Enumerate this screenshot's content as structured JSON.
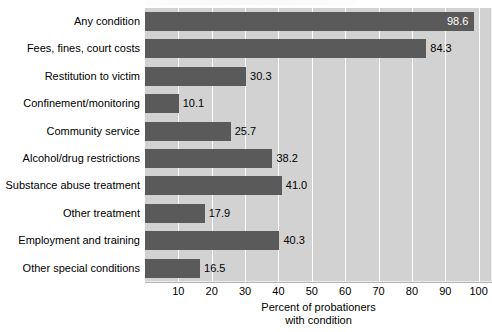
{
  "chart_data": {
    "type": "bar",
    "orientation": "horizontal",
    "title": "",
    "xlabel": "Percent of probationers with condition",
    "xlabel_lines": [
      "Percent of probationers",
      "with condition"
    ],
    "ylabel": "",
    "categories": [
      "Any condition",
      "Fees, fines, court costs",
      "Restitution to victim",
      "Confinement/monitoring",
      "Community service",
      "Alcohol/drug restrictions",
      "Substance abuse treatment",
      "Other treatment",
      "Employment and training",
      "Other special conditions"
    ],
    "values": [
      98.6,
      84.3,
      30.3,
      10.1,
      25.7,
      38.2,
      41.0,
      17.9,
      40.3,
      16.5
    ],
    "value_labels": [
      "98.6",
      "84.3",
      "30.3",
      "10.1",
      "25.7",
      "38.2",
      "41.0",
      "17.9",
      "40.3",
      "16.5"
    ],
    "label_placement": [
      "inside",
      "outside",
      "outside",
      "outside",
      "outside",
      "outside",
      "outside",
      "outside",
      "outside",
      "outside"
    ],
    "xlim": [
      0,
      104
    ],
    "xticks": [
      10,
      20,
      30,
      40,
      50,
      60,
      70,
      80,
      90,
      100
    ],
    "xtick_labels": [
      "10",
      "20",
      "30",
      "40",
      "50",
      "60",
      "70",
      "80",
      "90",
      "100"
    ],
    "grid": "vertical-white",
    "legend": null,
    "colors": {
      "bar": "#5a5a5a",
      "plot_background": "#d2d2d2",
      "gridline": "#ffffff",
      "page_background": "#ffffff",
      "text": "#000000",
      "inside_label_text": "#ffffff"
    }
  }
}
